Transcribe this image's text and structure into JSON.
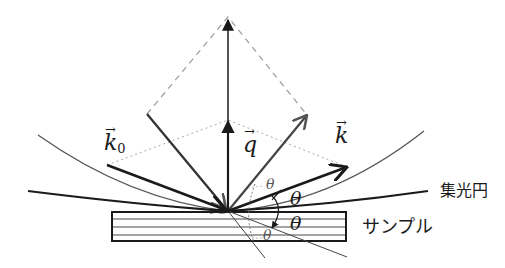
{
  "figure": {
    "type": "x-ray scattering geometry diagram",
    "colors": {
      "line": "#1a1a1a",
      "gray_line": "#555555",
      "dashed": "#9a9a9a",
      "dotted": "#aaaaaa",
      "background": "#ffffff"
    }
  },
  "labels": {
    "k0": "k",
    "k0_sub": "0",
    "q": "q",
    "k": "k",
    "vec_arrow": "→",
    "theta_1": "θ",
    "theta_2": "θ",
    "theta_3": "θ",
    "theta_4": "θ",
    "focusing_circle": "集光円",
    "sample": "サンプル"
  }
}
